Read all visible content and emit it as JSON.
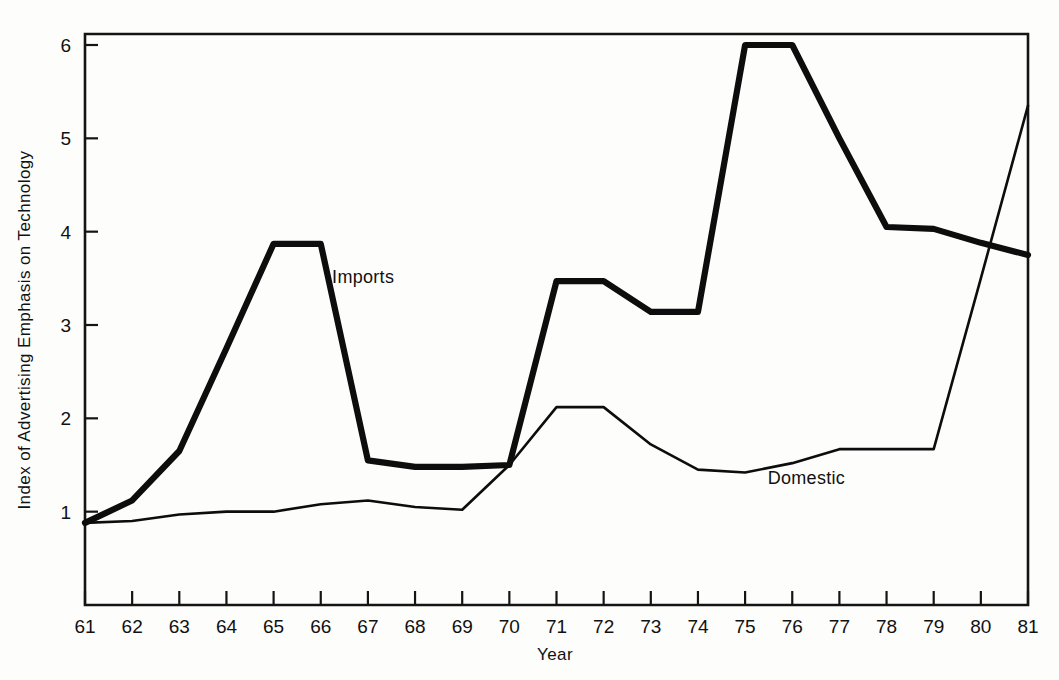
{
  "chart_data": {
    "type": "line",
    "title": "",
    "xlabel": "Year",
    "ylabel": "Index of Advertising Emphasis on Technology",
    "x": [
      61,
      62,
      63,
      64,
      65,
      66,
      67,
      68,
      69,
      70,
      71,
      72,
      73,
      74,
      75,
      76,
      77,
      78,
      79,
      80,
      81
    ],
    "xtick_labels": [
      "61",
      "62",
      "63",
      "64",
      "65",
      "66",
      "67",
      "68",
      "69",
      "70",
      "71",
      "72",
      "73",
      "74",
      "75",
      "76",
      "77",
      "78",
      "79",
      "80",
      "81"
    ],
    "ytick_labels": [
      "1",
      "2",
      "3",
      "4",
      "5",
      "6"
    ],
    "ytick_values": [
      1,
      2,
      3,
      4,
      5,
      6
    ],
    "xlim": [
      61,
      81
    ],
    "ylim": [
      0,
      6.3
    ],
    "grid": false,
    "legend_position": "inline-annotations",
    "series": [
      {
        "name": "Imports",
        "style": "thick",
        "values": [
          0.88,
          1.12,
          1.65,
          2.75,
          3.87,
          3.87,
          1.55,
          1.48,
          1.48,
          1.5,
          3.47,
          3.47,
          3.14,
          3.14,
          6.0,
          6.0,
          5.0,
          4.05,
          4.03,
          3.88,
          3.75
        ]
      },
      {
        "name": "Domestic",
        "style": "thin",
        "values": [
          0.88,
          0.9,
          0.97,
          1.0,
          1.0,
          1.08,
          1.12,
          1.05,
          1.02,
          1.5,
          2.12,
          2.12,
          1.72,
          1.45,
          1.42,
          1.52,
          1.67,
          1.67,
          1.67,
          3.5,
          5.35
        ]
      }
    ],
    "annotations": [
      {
        "text": "Imports",
        "x": 66.9,
        "y": 3.45
      },
      {
        "text": "Domestic",
        "x": 76.3,
        "y": 1.3
      }
    ]
  },
  "axes": {
    "y_title": "Index of Advertising Emphasis on Technology",
    "x_title": "Year"
  },
  "labels": {
    "imports": "Imports",
    "domestic": "Domestic"
  }
}
